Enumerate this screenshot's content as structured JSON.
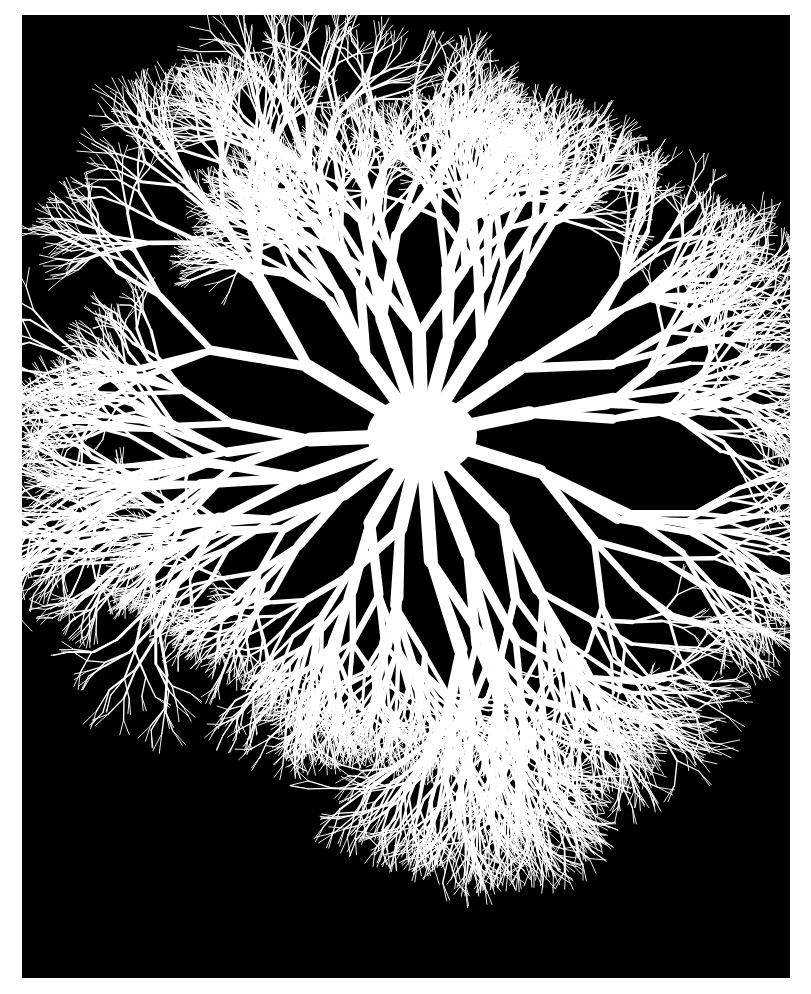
{
  "image": {
    "subject": "lung vascular tree cast",
    "background_color": "#000000",
    "foreground_color": "#ffffff",
    "frame_color": "#ffffff"
  }
}
